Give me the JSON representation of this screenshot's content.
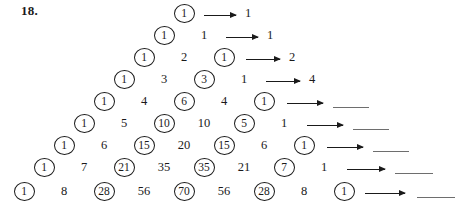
{
  "worksheet": {
    "problem_number": "18.",
    "description": "Pascal's triangle rows with selected entries circled; each row leads by an arrow to a sum value or a blank answer line.",
    "rows": [
      {
        "row_index": 0,
        "top": 2,
        "start_left": 172,
        "cells": [
          {
            "value": "1",
            "circled": true
          }
        ],
        "arrow": {
          "left": 204,
          "width": 32
        },
        "result": "1",
        "result_left": 245,
        "blank": false
      },
      {
        "row_index": 1,
        "top": 24,
        "start_left": 152,
        "cells": [
          {
            "value": "1",
            "circled": true
          },
          {
            "value": "1",
            "circled": false
          }
        ],
        "arrow": {
          "left": 226,
          "width": 32
        },
        "result": "1",
        "result_left": 267,
        "blank": false
      },
      {
        "row_index": 2,
        "top": 46,
        "start_left": 132,
        "cells": [
          {
            "value": "1",
            "circled": true
          },
          {
            "value": "2",
            "circled": false
          },
          {
            "value": "1",
            "circled": true
          }
        ],
        "arrow": {
          "left": 246,
          "width": 34
        },
        "result": "2",
        "result_left": 289,
        "blank": false
      },
      {
        "row_index": 3,
        "top": 68,
        "start_left": 112,
        "cells": [
          {
            "value": "1",
            "circled": true
          },
          {
            "value": "3",
            "circled": false
          },
          {
            "value": "3",
            "circled": true
          },
          {
            "value": "1",
            "circled": false
          }
        ],
        "arrow": {
          "left": 266,
          "width": 34
        },
        "result": "4",
        "result_left": 309,
        "blank": false
      },
      {
        "row_index": 4,
        "top": 90,
        "start_left": 92,
        "cells": [
          {
            "value": "1",
            "circled": true
          },
          {
            "value": "4",
            "circled": false
          },
          {
            "value": "6",
            "circled": true
          },
          {
            "value": "4",
            "circled": false
          },
          {
            "value": "1",
            "circled": true
          }
        ],
        "arrow": {
          "left": 287,
          "width": 36
        },
        "result": "",
        "result_left": 333,
        "blank": true,
        "blank_left": 333,
        "blank_width": 36
      },
      {
        "row_index": 5,
        "top": 112,
        "start_left": 72,
        "cells": [
          {
            "value": "1",
            "circled": true
          },
          {
            "value": "5",
            "circled": false
          },
          {
            "value": "10",
            "circled": true
          },
          {
            "value": "10",
            "circled": false
          },
          {
            "value": "5",
            "circled": true
          },
          {
            "value": "1",
            "circled": false
          }
        ],
        "arrow": {
          "left": 307,
          "width": 36
        },
        "result": "",
        "result_left": 353,
        "blank": true,
        "blank_left": 353,
        "blank_width": 36
      },
      {
        "row_index": 6,
        "top": 134,
        "start_left": 52,
        "cells": [
          {
            "value": "1",
            "circled": true
          },
          {
            "value": "6",
            "circled": false
          },
          {
            "value": "15",
            "circled": true
          },
          {
            "value": "20",
            "circled": false
          },
          {
            "value": "15",
            "circled": true
          },
          {
            "value": "6",
            "circled": false
          },
          {
            "value": "1",
            "circled": true
          }
        ],
        "arrow": {
          "left": 327,
          "width": 36
        },
        "result": "",
        "result_left": 373,
        "blank": true,
        "blank_left": 373,
        "blank_width": 36
      },
      {
        "row_index": 7,
        "top": 156,
        "start_left": 32,
        "cells": [
          {
            "value": "1",
            "circled": true
          },
          {
            "value": "7",
            "circled": false
          },
          {
            "value": "21",
            "circled": true
          },
          {
            "value": "35",
            "circled": false
          },
          {
            "value": "35",
            "circled": true
          },
          {
            "value": "21",
            "circled": false
          },
          {
            "value": "7",
            "circled": true
          },
          {
            "value": "1",
            "circled": false
          }
        ],
        "arrow": {
          "left": 347,
          "width": 38
        },
        "result": "",
        "result_left": 395,
        "blank": true,
        "blank_left": 395,
        "blank_width": 38
      },
      {
        "row_index": 8,
        "top": 180,
        "start_left": 12,
        "cells": [
          {
            "value": "1",
            "circled": true
          },
          {
            "value": "8",
            "circled": false
          },
          {
            "value": "28",
            "circled": true
          },
          {
            "value": "56",
            "circled": false
          },
          {
            "value": "70",
            "circled": true
          },
          {
            "value": "56",
            "circled": false
          },
          {
            "value": "28",
            "circled": true
          },
          {
            "value": "8",
            "circled": false
          },
          {
            "value": "1",
            "circled": true
          }
        ],
        "arrow": {
          "left": 365,
          "width": 40
        },
        "result": "",
        "result_left": 417,
        "blank": true,
        "blank_left": 417,
        "blank_width": 38
      }
    ],
    "cell_spacing": 40
  }
}
